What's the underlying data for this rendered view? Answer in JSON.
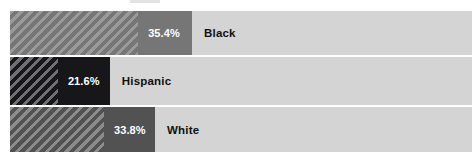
{
  "chart_data": {
    "type": "bar",
    "orientation": "horizontal",
    "title": "",
    "subtitle": "",
    "xlabel": "",
    "ylabel": "",
    "categories": [
      "Black",
      "Hispanic",
      "White"
    ],
    "values": [
      35.4,
      21.6,
      33.8
    ],
    "value_labels": [
      "35.4%",
      "21.6%",
      "33.8%"
    ],
    "units": "percent",
    "xlim": [
      0,
      100
    ],
    "grid": false,
    "legend": "none",
    "series": [
      {
        "name": "share",
        "values": [
          35.4,
          21.6,
          33.8
        ]
      }
    ],
    "bars": [
      {
        "category": "Black",
        "value": 35.4,
        "value_label": "35.4%",
        "bar_color": "#767676",
        "hatch_color": "#9a9a9a",
        "hatch": "diagonal-stripes",
        "hatch_fraction": 0.704,
        "fill_fraction": 0.394,
        "value_label_color": "#ffffff",
        "category_label_color": "#111111"
      },
      {
        "category": "Hispanic",
        "value": 21.6,
        "value_label": "21.6%",
        "bar_color": "#17171a",
        "hatch_color": "#6f6f74",
        "hatch": "diagonal-stripes",
        "hatch_fraction": 0.48,
        "fill_fraction": 0.216,
        "value_label_color": "#ffffff",
        "category_label_color": "#111111"
      },
      {
        "category": "White",
        "value": 33.8,
        "value_label": "33.8%",
        "bar_color": "#525252",
        "hatch_color": "#8c8c8c",
        "hatch": "diagonal-stripes",
        "hatch_fraction": 0.648,
        "fill_fraction": 0.314,
        "value_label_color": "#ffffff",
        "category_label_color": "#111111"
      }
    ],
    "track_color": "#d4d4d4",
    "background_color": "#ffffff"
  }
}
